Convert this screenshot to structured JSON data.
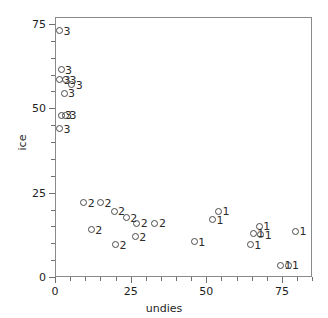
{
  "chart_data": {
    "type": "scatter",
    "title": "",
    "xlabel": "undies",
    "ylabel": "ice",
    "xlim": [
      -3,
      88
    ],
    "ylim": [
      -2,
      77
    ],
    "xticks": [
      0,
      25,
      50,
      75
    ],
    "yticks": [
      0,
      25,
      50,
      75
    ],
    "xtick_minor_step": 5,
    "ytick_minor_step": 5,
    "grid": false,
    "legend": false,
    "marker": "open-circle",
    "point_label_note": "each point is annotated with its group number",
    "groups": [
      "1",
      "2",
      "3"
    ],
    "points": [
      {
        "x": 1.5,
        "y": 73.0,
        "label": "3"
      },
      {
        "x": 2.0,
        "y": 61.5,
        "label": "3"
      },
      {
        "x": 1.5,
        "y": 58.5,
        "label": "3"
      },
      {
        "x": 3.5,
        "y": 58.5,
        "label": "3"
      },
      {
        "x": 5.5,
        "y": 57.0,
        "label": "3"
      },
      {
        "x": 3.0,
        "y": 54.5,
        "label": "3"
      },
      {
        "x": 2.0,
        "y": 48.0,
        "label": "3"
      },
      {
        "x": 3.5,
        "y": 48.0,
        "label": "3"
      },
      {
        "x": 1.5,
        "y": 44.0,
        "label": "3"
      },
      {
        "x": 9.5,
        "y": 22.0,
        "label": "2"
      },
      {
        "x": 15.0,
        "y": 22.0,
        "label": "2"
      },
      {
        "x": 19.5,
        "y": 19.5,
        "label": "2"
      },
      {
        "x": 23.5,
        "y": 17.5,
        "label": "2"
      },
      {
        "x": 27.0,
        "y": 16.0,
        "label": "2"
      },
      {
        "x": 12.0,
        "y": 14.0,
        "label": "2"
      },
      {
        "x": 33.0,
        "y": 16.0,
        "label": "2"
      },
      {
        "x": 26.5,
        "y": 12.0,
        "label": "2"
      },
      {
        "x": 20.0,
        "y": 9.5,
        "label": "2"
      },
      {
        "x": 54.0,
        "y": 19.5,
        "label": "1"
      },
      {
        "x": 52.0,
        "y": 17.0,
        "label": "1"
      },
      {
        "x": 67.5,
        "y": 15.0,
        "label": "1"
      },
      {
        "x": 65.5,
        "y": 13.0,
        "label": "1"
      },
      {
        "x": 68.0,
        "y": 12.5,
        "label": "1"
      },
      {
        "x": 79.5,
        "y": 13.5,
        "label": "1"
      },
      {
        "x": 46.0,
        "y": 10.5,
        "label": "1"
      },
      {
        "x": 64.5,
        "y": 9.5,
        "label": "1"
      },
      {
        "x": 74.5,
        "y": 3.5,
        "label": "1"
      },
      {
        "x": 77.0,
        "y": 3.5,
        "label": "1"
      }
    ]
  },
  "axes": {
    "x_tick_labels": [
      "0",
      "25",
      "50",
      "75"
    ],
    "y_tick_labels": [
      "0",
      "25",
      "50",
      "75"
    ],
    "x_axis_title": "undies",
    "y_axis_title": "ice"
  }
}
